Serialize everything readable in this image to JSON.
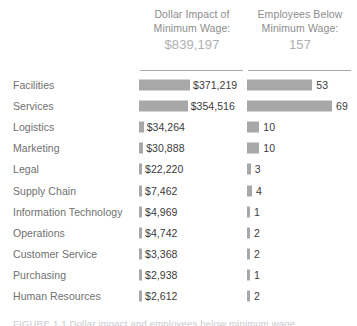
{
  "figure": {
    "background_color": "#ffffff",
    "bar_color": "#a8a8a8",
    "label_color": "#6f6f6f",
    "value_color": "#3b3b3b",
    "header_color": "#8d8d8d",
    "caption_partial": "FIGURE 1.1   Dollar impact and employees  below minimum wage"
  },
  "columns": {
    "dollar": {
      "title_line1": "Dollar Impact of",
      "title_line2": "Minimum Wage:",
      "total": "$839,197"
    },
    "employees": {
      "title_line1": "Employees Below",
      "title_line2": "Minimum Wage:",
      "total": "157"
    }
  },
  "chart_data": {
    "type": "bar",
    "xlabel": "",
    "ylabel": "Department",
    "grid": false,
    "legend": "none",
    "orientation": "horizontal",
    "sorted_by": "Dollar Impact of Minimum Wage, descending",
    "categories": [
      "Facilities",
      "Services",
      "Logistics",
      "Marketing",
      "Legal",
      "Supply Chain",
      "Information Technology",
      "Operations",
      "Customer Service",
      "Purchasing",
      "Human Resources"
    ],
    "series": [
      {
        "name": "Dollar Impact of Minimum Wage",
        "total": 839197,
        "total_label": "$839,197",
        "max": 371219,
        "values": [
          371219,
          354516,
          34264,
          30888,
          22220,
          7462,
          4969,
          4742,
          3368,
          2938,
          2612
        ],
        "labels": [
          "$371,219",
          "$354,516",
          "$34,264",
          "$30,888",
          "$22,220",
          "$7,462",
          "$4,969",
          "$4,742",
          "$3,368",
          "$2,938",
          "$2,612"
        ]
      },
      {
        "name": "Employees Below Minimum Wage",
        "total": 157,
        "total_label": "157",
        "max": 69,
        "values": [
          53,
          69,
          10,
          10,
          3,
          4,
          1,
          2,
          2,
          1,
          2
        ],
        "labels": [
          "53",
          "69",
          "10",
          "10",
          "3",
          "4",
          "1",
          "2",
          "2",
          "1",
          "2"
        ]
      }
    ]
  }
}
